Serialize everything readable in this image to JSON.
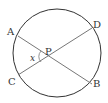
{
  "diagram": {
    "type": "geometry",
    "points": {
      "A": {
        "label": "A"
      },
      "B": {
        "label": "B"
      },
      "C": {
        "label": "C"
      },
      "D": {
        "label": "D"
      },
      "P": {
        "label": "P"
      }
    },
    "angle_label": "x",
    "colors": {
      "circle": "#333333",
      "chord": "#777777"
    }
  }
}
